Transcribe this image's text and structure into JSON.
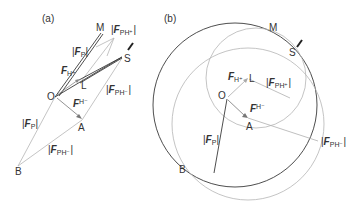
{
  "figure": {
    "panels": [
      {
        "id": "a",
        "label": "(a)",
        "points": {
          "M": "M",
          "S": "S",
          "O": "O",
          "L": "L",
          "A": "A",
          "B": "B"
        },
        "labels": [
          {
            "key": "fp_top",
            "bar_left": "|",
            "main": "F",
            "sub": "P",
            "bar_right": "|"
          },
          {
            "key": "fph_plus",
            "bar_left": "|",
            "main": "F",
            "sub": "PH⁺",
            "bar_right": "|"
          },
          {
            "key": "fh_plus",
            "bar_left": "",
            "main": "F",
            "sub": "H⁺",
            "bar_right": ""
          },
          {
            "key": "fph_minus_top",
            "bar_left": "|",
            "main": "F",
            "sub": "PH⁻",
            "bar_right": "|"
          },
          {
            "key": "fh_minus",
            "bar_left": "",
            "main": "F",
            "sub": "H⁻",
            "bar_right": ""
          },
          {
            "key": "fp_bottom",
            "bar_left": "|",
            "main": "F",
            "sub": "P",
            "bar_right": "|"
          },
          {
            "key": "fph_minus_bottom",
            "bar_left": "|",
            "main": "F",
            "sub": "PH⁻",
            "bar_right": "|"
          }
        ]
      },
      {
        "id": "b",
        "label": "(b)",
        "points": {
          "M": "M",
          "S": "S",
          "O": "O",
          "L": "L",
          "A": "A",
          "B": "B"
        },
        "labels": [
          {
            "key": "fh_plus",
            "bar_left": "",
            "main": "F",
            "sub": "H⁺",
            "bar_right": ""
          },
          {
            "key": "fph_plus",
            "bar_left": "|",
            "main": "F",
            "sub": "PH⁺",
            "bar_right": "|"
          },
          {
            "key": "fh_minus",
            "bar_left": "",
            "main": "F",
            "sub": "H⁻",
            "bar_right": ""
          },
          {
            "key": "fp",
            "bar_left": "|",
            "main": "F",
            "sub": "P",
            "bar_right": "|"
          },
          {
            "key": "fph_minus",
            "bar_left": "|",
            "main": "F",
            "sub": "PH⁻",
            "bar_right": "|"
          }
        ]
      }
    ],
    "colors": {
      "dark_line": "#3a3a3a",
      "gray_line": "#b0b0b0",
      "text": "#333333"
    }
  }
}
